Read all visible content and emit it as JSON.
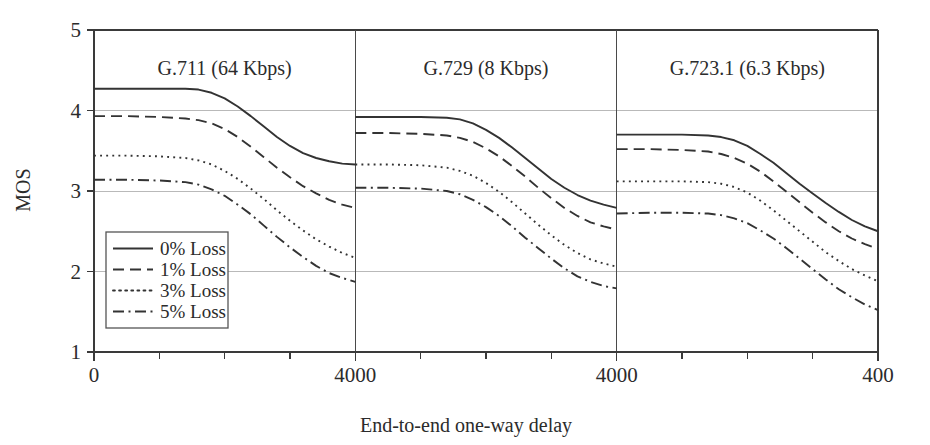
{
  "chart_data": {
    "type": "line",
    "title": "",
    "xlabel": "End-to-end one-way delay",
    "ylabel": "MOS",
    "ylim": [
      1,
      5
    ],
    "xlim": [
      0,
      4000
    ],
    "y_ticks": [
      "5",
      "4",
      "3",
      "2",
      "1"
    ],
    "y_tick_values": [
      5,
      4,
      3,
      2,
      1
    ],
    "grid": "horizontal gridlines at MOS 4, 3 and 2",
    "legend_position": "lower-left inside first panel",
    "panel_layout": "three side-by-side panels sharing one MOS axis, each spanning delay 0 to 4000 ms",
    "minor_x_ticks_per_panel": 4,
    "x_tick_labels": [
      "0",
      "4000",
      "4000",
      "400"
    ],
    "series_styles": [
      "solid",
      "dashed",
      "dotted",
      "dash-dot"
    ],
    "legend": [
      {
        "label": "0% Loss",
        "style": "solid"
      },
      {
        "label": "1% Loss",
        "style": "dashed"
      },
      {
        "label": "3% Loss",
        "style": "dotted"
      },
      {
        "label": "5% Loss",
        "style": "dash-dot"
      }
    ],
    "panels": [
      {
        "title": "G.711 (64 Kbps)",
        "x": [
          0,
          500,
          1000,
          1400,
          1600,
          1800,
          2000,
          2200,
          2400,
          2600,
          2800,
          3000,
          3200,
          3400,
          3600,
          3800,
          4000
        ],
        "series": [
          {
            "name": "0% Loss",
            "style": "solid",
            "values": [
              4.27,
              4.27,
              4.27,
              4.27,
              4.26,
              4.22,
              4.15,
              4.05,
              3.93,
              3.8,
              3.67,
              3.56,
              3.47,
              3.41,
              3.37,
              3.34,
              3.33
            ]
          },
          {
            "name": "1% Loss",
            "style": "dashed",
            "values": [
              3.93,
              3.93,
              3.92,
              3.9,
              3.88,
              3.84,
              3.77,
              3.67,
              3.55,
              3.42,
              3.29,
              3.17,
              3.06,
              2.97,
              2.89,
              2.83,
              2.79
            ]
          },
          {
            "name": "3% Loss",
            "style": "dotted",
            "values": [
              3.44,
              3.44,
              3.43,
              3.41,
              3.38,
              3.33,
              3.25,
              3.15,
              3.03,
              2.9,
              2.76,
              2.63,
              2.51,
              2.4,
              2.31,
              2.23,
              2.17
            ]
          },
          {
            "name": "5% Loss",
            "style": "dash-dot",
            "values": [
              3.14,
              3.14,
              3.13,
              3.11,
              3.08,
              3.02,
              2.94,
              2.83,
              2.71,
              2.57,
              2.43,
              2.3,
              2.18,
              2.07,
              1.98,
              1.92,
              1.87
            ]
          }
        ]
      },
      {
        "title": "G.729 (8 Kbps)",
        "x": [
          0,
          500,
          1000,
          1400,
          1600,
          1800,
          2000,
          2200,
          2400,
          2600,
          2800,
          3000,
          3200,
          3400,
          3600,
          3800,
          4000
        ],
        "series": [
          {
            "name": "0% Loss",
            "style": "solid",
            "values": [
              3.92,
              3.92,
              3.92,
              3.91,
              3.89,
              3.84,
              3.76,
              3.66,
              3.54,
              3.41,
              3.28,
              3.15,
              3.04,
              2.95,
              2.88,
              2.83,
              2.79
            ]
          },
          {
            "name": "1% Loss",
            "style": "dashed",
            "values": [
              3.72,
              3.72,
              3.71,
              3.69,
              3.66,
              3.61,
              3.53,
              3.43,
              3.31,
              3.18,
              3.04,
              2.91,
              2.79,
              2.69,
              2.61,
              2.56,
              2.52
            ]
          },
          {
            "name": "3% Loss",
            "style": "dotted",
            "values": [
              3.33,
              3.33,
              3.32,
              3.29,
              3.25,
              3.19,
              3.1,
              2.99,
              2.86,
              2.72,
              2.58,
              2.45,
              2.33,
              2.23,
              2.15,
              2.1,
              2.06
            ]
          },
          {
            "name": "5% Loss",
            "style": "dash-dot",
            "values": [
              3.04,
              3.04,
              3.03,
              3.0,
              2.96,
              2.89,
              2.8,
              2.69,
              2.56,
              2.42,
              2.29,
              2.16,
              2.04,
              1.94,
              1.87,
              1.82,
              1.79
            ]
          }
        ]
      },
      {
        "title": "G.723.1 (6.3 Kbps)",
        "x": [
          0,
          500,
          1000,
          1400,
          1600,
          1800,
          2000,
          2200,
          2400,
          2600,
          2800,
          3000,
          3200,
          3400,
          3600,
          3800,
          4000
        ],
        "series": [
          {
            "name": "0% Loss",
            "style": "solid",
            "values": [
              3.7,
              3.7,
              3.7,
              3.69,
              3.67,
              3.63,
              3.56,
              3.46,
              3.35,
              3.22,
              3.09,
              2.97,
              2.85,
              2.74,
              2.64,
              2.56,
              2.5
            ]
          },
          {
            "name": "1% Loss",
            "style": "dashed",
            "values": [
              3.52,
              3.52,
              3.51,
              3.49,
              3.46,
              3.41,
              3.34,
              3.24,
              3.12,
              2.99,
              2.86,
              2.73,
              2.61,
              2.5,
              2.41,
              2.34,
              2.28
            ]
          },
          {
            "name": "3% Loss",
            "style": "dotted",
            "values": [
              3.12,
              3.12,
              3.12,
              3.11,
              3.09,
              3.05,
              2.98,
              2.88,
              2.76,
              2.63,
              2.5,
              2.37,
              2.24,
              2.13,
              2.03,
              1.95,
              1.88
            ]
          },
          {
            "name": "5% Loss",
            "style": "dash-dot",
            "values": [
              2.72,
              2.73,
              2.73,
              2.72,
              2.7,
              2.66,
              2.6,
              2.51,
              2.41,
              2.29,
              2.16,
              2.03,
              1.9,
              1.78,
              1.68,
              1.59,
              1.52
            ]
          }
        ]
      }
    ]
  },
  "colors": {
    "ink": "#2b2b2b",
    "line": "#333333",
    "grid": "#b9b9b9",
    "axis": "#3a3a3a",
    "background": "#ffffff"
  }
}
